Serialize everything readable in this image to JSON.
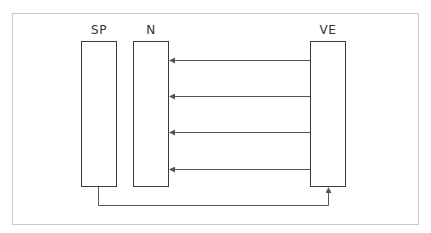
{
  "diagram": {
    "frame_color": "#c8c8c8",
    "line_color": "#555555",
    "box_border_color": "#3a3a3a",
    "nodes": [
      {
        "id": "sp",
        "label": "SP",
        "x": 81,
        "y": 41,
        "w": 36,
        "h": 146
      },
      {
        "id": "n",
        "label": "N",
        "x": 133,
        "y": 41,
        "w": 36,
        "h": 146
      },
      {
        "id": "ve",
        "label": "VE",
        "x": 310,
        "y": 41,
        "w": 36,
        "h": 146
      }
    ],
    "edges": [
      {
        "from": "VE",
        "to": "N",
        "y": 60
      },
      {
        "from": "VE",
        "to": "N",
        "y": 96
      },
      {
        "from": "VE",
        "to": "N",
        "y": 132
      },
      {
        "from": "VE",
        "to": "N",
        "y": 169
      },
      {
        "from": "SP",
        "to": "VE",
        "route": "bottom-elbow",
        "y": 205
      }
    ]
  }
}
